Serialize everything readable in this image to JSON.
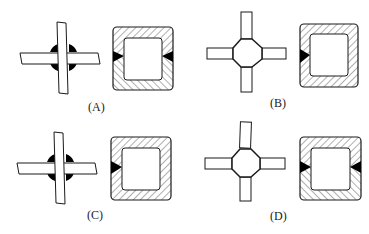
{
  "figure": {
    "options": [
      {
        "id": "A",
        "label": "(A)",
        "joint_type": "cross-plate with four fillet welds",
        "section": "two-part hollow section, welds both sides"
      },
      {
        "id": "B",
        "label": "(B)",
        "joint_type": "diamond node with four plates",
        "section": "single-piece hollow section, weld left side only"
      },
      {
        "id": "C",
        "label": "(C)",
        "joint_type": "cross-plate with four fillet welds",
        "section": "single-piece hollow section, weld left side only"
      },
      {
        "id": "D",
        "label": "(D)",
        "joint_type": "diamond node with four plates",
        "section": "two-part hollow section, welds both sides"
      }
    ],
    "colors": {
      "line": "#1a1a1a",
      "weld": "#000000",
      "background": "#ffffff"
    }
  }
}
